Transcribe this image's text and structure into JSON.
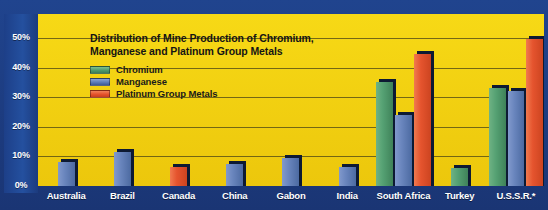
{
  "chart_data": {
    "type": "bar",
    "title": "Distribution of Mine Production of Chromium, Manganese and Platinum Group Metals",
    "title_line1": "Distribution of Mine Production of Chromium,",
    "title_line2": "Manganese and Platinum Group Metals",
    "xlabel": "",
    "ylabel": "",
    "ylim": [
      0,
      50
    ],
    "ytick_labels": [
      "50%",
      "40%",
      "30%",
      "20%",
      "10%",
      "0%"
    ],
    "ytick_values": [
      50,
      40,
      30,
      20,
      10,
      0
    ],
    "grid": true,
    "legend_position": "top-left",
    "categories": [
      "Australia",
      "Brazil",
      "Canada",
      "China",
      "Gabon",
      "India",
      "South Africa",
      "Turkey",
      "U.S.S.R.*"
    ],
    "series": [
      {
        "name": "Chromium",
        "color": "#55a173",
        "values": [
          0,
          0,
          0,
          0,
          0,
          0,
          35,
          6,
          33
        ]
      },
      {
        "name": "Manganese",
        "color": "#6985bd",
        "values": [
          8,
          11.5,
          0,
          7.5,
          9.5,
          6.5,
          24,
          0,
          32
        ]
      },
      {
        "name": "Platinum Group Metals",
        "color": "#e5542e",
        "values": [
          0,
          0,
          6.5,
          0,
          0,
          0,
          44.5,
          0,
          49.5
        ]
      }
    ],
    "colors": {
      "background": "#f3d112",
      "frame": "#1f4189",
      "chromium": "#55a173",
      "manganese": "#6985bd",
      "platinum": "#e5542e",
      "gridline": "#4a4416",
      "axis_text": "#ffffff",
      "title_text": "#141414"
    }
  }
}
